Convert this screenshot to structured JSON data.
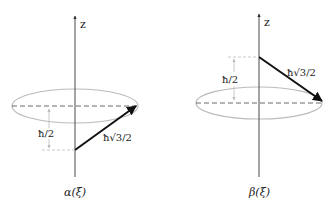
{
  "diagrams": [
    {
      "id": "alpha",
      "caption": "α(ξ)",
      "axis_label": "z",
      "height_label": "ħ/2",
      "vector_label": "ħ√3/2",
      "vector_direction": "pointing up from below cone plane to ellipse edge"
    },
    {
      "id": "beta",
      "caption": "β(ξ)",
      "axis_label": "z",
      "height_label": "ħ/2",
      "vector_label": "ħ√3/2",
      "vector_direction": "pointing down from above cone plane to ellipse edge"
    }
  ],
  "colors": {
    "line": "#111111",
    "ellipse": "#bbbbbb",
    "guide": "#aaaaaa"
  }
}
